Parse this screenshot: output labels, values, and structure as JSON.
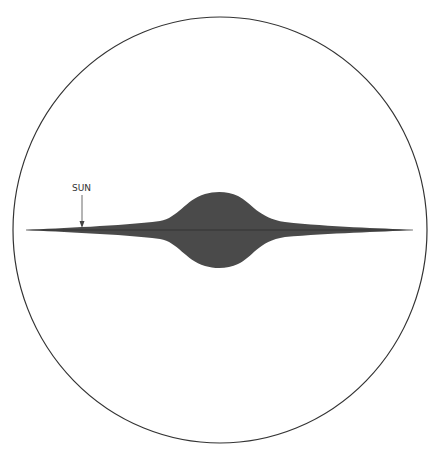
{
  "diagram": {
    "labels": {
      "sun": "SUN"
    },
    "colors": {
      "galaxy": "#4a4a4a",
      "outline": "#333333",
      "background": "#ffffff"
    }
  }
}
